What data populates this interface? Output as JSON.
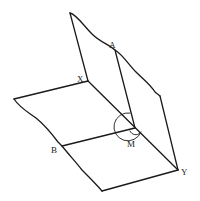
{
  "diagram": {
    "type": "geometry-dihedral-angle",
    "labels": {
      "A": "A",
      "X": "X",
      "B": "B",
      "M": "M",
      "Y": "Y"
    },
    "colors": {
      "stroke": "#1a1a1a",
      "background": "#ffffff"
    }
  }
}
